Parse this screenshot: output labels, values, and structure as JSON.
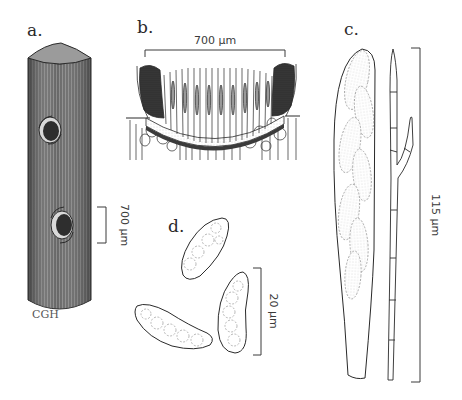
{
  "figure": {
    "panels": [
      {
        "id": "a",
        "label": "a.",
        "description": "stem with ascomata",
        "scale_bar": {
          "value": "700 µm",
          "orientation": "vertical"
        }
      },
      {
        "id": "b",
        "label": "b.",
        "description": "apothecium cross-section",
        "scale_bar": {
          "value": "700 µm",
          "orientation": "horizontal"
        }
      },
      {
        "id": "c",
        "label": "c.",
        "description": "ascus and paraphysis",
        "scale_bar": {
          "value": "115 µm",
          "orientation": "vertical"
        }
      },
      {
        "id": "d",
        "label": "d.",
        "description": "ascospores",
        "scale_bar": {
          "value": "20 µm",
          "orientation": "vertical"
        }
      }
    ],
    "signature": "CGH"
  },
  "colors": {
    "ink": "#2a2a2a",
    "stipple_dark": "#3b3b3b",
    "stipple_mid": "#7a7a7a",
    "dotted": "#9a9a9a"
  }
}
